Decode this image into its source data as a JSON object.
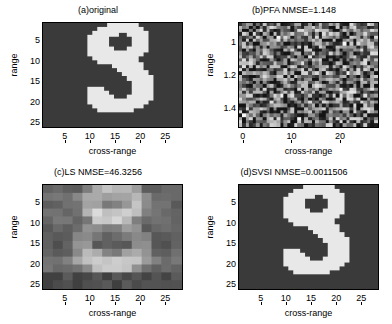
{
  "figure": {
    "background": "#ffffff",
    "image_low_color": "#3a3a3a",
    "image_high_color": "#e8e8e8"
  },
  "chart_data": [
    {
      "type": "heatmap",
      "panel": "a",
      "title": "(a)original",
      "xlabel": "cross-range",
      "ylabel": "range",
      "xticks": [
        5,
        10,
        15,
        20,
        25
      ],
      "xtick_labels": [
        "5",
        "10",
        "15",
        "20",
        "25"
      ],
      "yticks": [
        5,
        10,
        15,
        20,
        25
      ],
      "ytick_labels": [
        "5",
        "10",
        "15",
        "20",
        "25"
      ],
      "xlim": [
        0.5,
        28.5
      ],
      "ylim": [
        0.5,
        26.5
      ],
      "grid": false,
      "colormap": "gray",
      "zlim": [
        0,
        1
      ],
      "description": "Binary image of letter S, bright on dark background",
      "shape_rows": [
        "0000000000000111111000000000",
        "0000000000011111111100000000",
        "0000000000111110011110000000",
        "0000000001111000001110000000",
        "0000000001111000001110000000",
        "0000000001111000001110000000",
        "0000000001111100011110000000",
        "0000000001111111111100000000",
        "0000000000111111111000000000",
        "0000000000011111111000000000",
        "0000000000000011111100000000",
        "0000000000000001111100000000",
        "0000000000000000111110000000",
        "0000000000000000011111000000",
        "0000000000000000001111000000",
        "0000000000000000001111000000",
        "0000000001110000001111000000",
        "0000000001111000001111000000",
        "0000000001111100011111000000",
        "0000000001111111111110000000",
        "0000000000111111111100000000",
        "0000000000011111110000000000",
        "0000000000000000000000000000",
        "0000000000000000000000000000",
        "0000000000000000000000000000",
        "0000000000000000000000000000"
      ]
    },
    {
      "type": "heatmap",
      "panel": "b",
      "title": "(b)PFA  NMSE=1.148",
      "method": "PFA",
      "nmse": 1.148,
      "xlabel": "cross-range",
      "ylabel": "range",
      "xticks": [
        0,
        10,
        20
      ],
      "xtick_labels": [
        "0",
        "10",
        "20"
      ],
      "yticks": [
        1,
        1.2,
        1.4
      ],
      "ytick_labels": [
        "1",
        "1.2",
        "1.4"
      ],
      "xlim": [
        -1,
        28
      ],
      "ylim": [
        0.88,
        1.52
      ],
      "grid": false,
      "colormap": "gray",
      "description": "Dense random speckle noise, no recognizable S structure",
      "noise_seed": 17,
      "noise_mean": 0.42,
      "noise_spread": 0.45,
      "cell_cols": 40,
      "cell_rows": 32
    },
    {
      "type": "heatmap",
      "panel": "c",
      "title": "(c)LS  NMSE=46.3256",
      "method": "LS",
      "nmse": 46.3256,
      "xlabel": "cross-range",
      "ylabel": "range",
      "xticks": [
        5,
        10,
        15,
        20,
        25
      ],
      "xtick_labels": [
        "5",
        "10",
        "15",
        "20",
        "25"
      ],
      "yticks": [
        5,
        10,
        15,
        20,
        25
      ],
      "ytick_labels": [
        "5",
        "10",
        "15",
        "20",
        "25"
      ],
      "xlim": [
        0.5,
        28.5
      ],
      "ylim": [
        0.5,
        26.5
      ],
      "grid": false,
      "colormap": "gray",
      "description": "Blurred blocky reconstruction with symmetric bright bands, S barely visible",
      "blocks_cols": 14,
      "blocks_rows": 13
    },
    {
      "type": "heatmap",
      "panel": "d",
      "title": "(d)SVSI  NMSE=0.0011506",
      "method": "SVSI",
      "nmse": 0.0011506,
      "xlabel": "cross-range",
      "ylabel": "range",
      "xticks": [
        5,
        10,
        15,
        20,
        25
      ],
      "xtick_labels": [
        "5",
        "10",
        "15",
        "20",
        "25"
      ],
      "yticks": [
        5,
        10,
        15,
        20,
        25
      ],
      "ytick_labels": [
        "5",
        "10",
        "15",
        "20",
        "25"
      ],
      "xlim": [
        0.5,
        28.5
      ],
      "ylim": [
        0.5,
        26.5
      ],
      "grid": false,
      "colormap": "gray",
      "description": "Near-perfect reconstruction of letter S, visually identical to original",
      "shape_rows": [
        "0000000000000111111000000000",
        "0000000000011111111100000000",
        "0000000000111110011110000000",
        "0000000001111000001110000000",
        "0000000001111000001110000000",
        "0000000001111000001110000000",
        "0000000001111100011110000000",
        "0000000001111111111100000000",
        "0000000000111111111000000000",
        "0000000000011111111000000000",
        "0000000000000011111100000000",
        "0000000000000001111100000000",
        "0000000000000000111110000000",
        "0000000000000000011111000000",
        "0000000000000000001111000000",
        "0000000000000000001111000000",
        "0000000001110000001111000000",
        "0000000001111000001111000000",
        "0000000001111100011111000000",
        "0000000001111111111110000000",
        "0000000000111111111100000000",
        "0000000000011111110000000000",
        "0000000000000000000000000000",
        "0000000000000000000000000000",
        "0000000000000000000000000000",
        "0000000000000000000000000000"
      ]
    }
  ]
}
